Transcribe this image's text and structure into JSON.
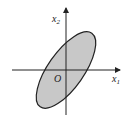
{
  "diagram": {
    "axes": {
      "x_label": "x",
      "x_sub": "1",
      "y_label": "x",
      "y_sub": "2",
      "origin_label": "O"
    },
    "ellipse": {
      "fill": "#c8c8c8",
      "stroke": "#222222",
      "center": [
        66,
        70
      ],
      "rx": 45,
      "ry": 18,
      "rotation_deg": -55
    },
    "colors": {
      "axis": "#222222",
      "background": "#ffffff"
    }
  }
}
